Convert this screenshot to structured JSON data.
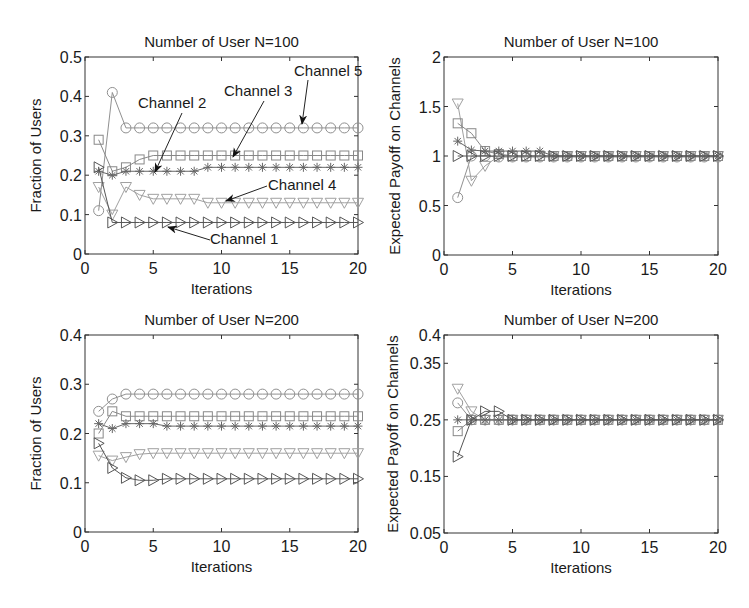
{
  "figure": {
    "background": "#ffffff",
    "axis_color": "#333333"
  },
  "series_styles": {
    "channel_1": {
      "marker": "triangle-right",
      "color": "#555555"
    },
    "channel_2": {
      "marker": "asterisk",
      "color": "#666666"
    },
    "channel_3": {
      "marker": "square",
      "color": "#888888"
    },
    "channel_4": {
      "marker": "triangle-down",
      "color": "#a0a0a0"
    },
    "channel_5": {
      "marker": "circle",
      "color": "#909090"
    }
  },
  "chart_data": [
    {
      "id": "top_left",
      "type": "line",
      "title": "Number of User N=100",
      "xlabel": "Iterations",
      "ylabel": "Fraction of Users",
      "xlim": [
        0,
        20
      ],
      "ylim": [
        0,
        0.5
      ],
      "xticks": [
        0,
        5,
        10,
        15,
        20
      ],
      "yticks": [
        0,
        0.1,
        0.2,
        0.3,
        0.4,
        0.5
      ],
      "ytick_labels": [
        "0",
        "0.1",
        "0.2",
        "0.3",
        "0.4",
        "0.5"
      ],
      "grid": false,
      "frame": {
        "x0": 85,
        "x1": 358,
        "y0": 57,
        "y1": 254
      },
      "x": [
        1,
        2,
        3,
        4,
        5,
        6,
        7,
        8,
        9,
        10,
        11,
        12,
        13,
        14,
        15,
        16,
        17,
        18,
        19,
        20
      ],
      "series": [
        {
          "name": "Channel 1",
          "style": "channel_1",
          "values": [
            0.22,
            0.08,
            0.08,
            0.08,
            0.08,
            0.08,
            0.08,
            0.08,
            0.08,
            0.08,
            0.08,
            0.08,
            0.08,
            0.08,
            0.08,
            0.08,
            0.08,
            0.08,
            0.08,
            0.08
          ]
        },
        {
          "name": "Channel 2",
          "style": "channel_2",
          "values": [
            0.21,
            0.2,
            0.21,
            0.21,
            0.21,
            0.21,
            0.21,
            0.21,
            0.22,
            0.22,
            0.22,
            0.22,
            0.22,
            0.22,
            0.22,
            0.22,
            0.22,
            0.22,
            0.22,
            0.22
          ]
        },
        {
          "name": "Channel 3",
          "style": "channel_3",
          "values": [
            0.29,
            0.21,
            0.22,
            0.24,
            0.25,
            0.25,
            0.25,
            0.25,
            0.25,
            0.25,
            0.25,
            0.25,
            0.25,
            0.25,
            0.25,
            0.25,
            0.25,
            0.25,
            0.25,
            0.25
          ]
        },
        {
          "name": "Channel 4",
          "style": "channel_4",
          "values": [
            0.17,
            0.1,
            0.17,
            0.15,
            0.14,
            0.14,
            0.14,
            0.14,
            0.13,
            0.13,
            0.13,
            0.13,
            0.13,
            0.13,
            0.13,
            0.13,
            0.13,
            0.13,
            0.13,
            0.13
          ]
        },
        {
          "name": "Channel 5",
          "style": "channel_5",
          "values": [
            0.11,
            0.41,
            0.32,
            0.32,
            0.32,
            0.32,
            0.32,
            0.32,
            0.32,
            0.32,
            0.32,
            0.32,
            0.32,
            0.32,
            0.32,
            0.32,
            0.32,
            0.32,
            0.32,
            0.32
          ]
        }
      ],
      "annotations": [
        {
          "text": "Channel 5",
          "text_x": 294,
          "text_y": 76,
          "arrow_from": [
            308,
            80
          ],
          "arrow_to": [
            302,
            124
          ]
        },
        {
          "text": "Channel 3",
          "text_x": 224,
          "text_y": 96,
          "arrow_from": [
            264,
            101
          ],
          "arrow_to": [
            233,
            157
          ]
        },
        {
          "text": "Channel 2",
          "text_x": 138,
          "text_y": 108,
          "arrow_from": [
            182,
            113
          ],
          "arrow_to": [
            155,
            172
          ]
        },
        {
          "text": "Channel 4",
          "text_x": 268,
          "text_y": 190,
          "arrow_from": [
            267,
            186
          ],
          "arrow_to": [
            226,
            201
          ]
        },
        {
          "text": "Channel 1",
          "text_x": 210,
          "text_y": 244,
          "arrow_from": [
            210,
            240
          ],
          "arrow_to": [
            168,
            227
          ]
        }
      ]
    },
    {
      "id": "top_right",
      "type": "line",
      "title": "Number of User N=100",
      "xlabel": "Iterations",
      "ylabel": "Expected Payoff on Channels",
      "xlim": [
        0,
        20
      ],
      "ylim": [
        0,
        2
      ],
      "xticks": [
        0,
        5,
        10,
        15,
        20
      ],
      "yticks": [
        0,
        0.5,
        1,
        1.5,
        2
      ],
      "ytick_labels": [
        "0",
        "0.5",
        "1",
        "1.5",
        "2"
      ],
      "grid": false,
      "frame": {
        "x0": 444,
        "x1": 718,
        "y0": 57,
        "y1": 255
      },
      "x": [
        1,
        2,
        3,
        4,
        5,
        6,
        7,
        8,
        9,
        10,
        11,
        12,
        13,
        14,
        15,
        16,
        17,
        18,
        19,
        20
      ],
      "series": [
        {
          "name": "Channel 1",
          "style": "channel_1",
          "values": [
            1.0,
            1.0,
            1.0,
            1.0,
            1.0,
            1.0,
            1.0,
            1.0,
            1.0,
            1.0,
            1.0,
            1.0,
            1.0,
            1.0,
            1.0,
            1.0,
            1.0,
            1.0,
            1.0,
            1.0
          ]
        },
        {
          "name": "Channel 2",
          "style": "channel_2",
          "values": [
            1.15,
            1.06,
            1.05,
            1.05,
            1.05,
            1.05,
            1.05,
            1.0,
            1.0,
            1.0,
            1.0,
            1.0,
            1.0,
            1.0,
            1.0,
            1.0,
            1.0,
            1.0,
            1.0,
            1.0
          ]
        },
        {
          "name": "Channel 3",
          "style": "channel_3",
          "values": [
            1.33,
            1.23,
            1.05,
            1.02,
            1.0,
            1.0,
            1.0,
            1.0,
            1.0,
            1.0,
            1.0,
            1.0,
            1.0,
            1.0,
            1.0,
            1.0,
            1.0,
            1.0,
            1.0,
            1.0
          ]
        },
        {
          "name": "Channel 4",
          "style": "channel_4",
          "values": [
            1.53,
            0.75,
            0.9,
            1.0,
            1.0,
            1.0,
            1.0,
            1.0,
            1.0,
            1.0,
            1.0,
            1.0,
            1.0,
            1.0,
            1.0,
            1.0,
            1.0,
            1.0,
            1.0,
            1.0
          ]
        },
        {
          "name": "Channel 5",
          "style": "channel_5",
          "values": [
            0.58,
            1.0,
            1.0,
            0.99,
            0.99,
            0.99,
            0.99,
            0.99,
            0.99,
            0.99,
            0.99,
            0.99,
            0.99,
            0.99,
            0.99,
            0.99,
            0.99,
            0.99,
            0.99,
            0.99
          ]
        }
      ],
      "annotations": []
    },
    {
      "id": "bottom_left",
      "type": "line",
      "title": "Number of User N=200",
      "xlabel": "Iterations",
      "ylabel": "Fraction of Users",
      "xlim": [
        0,
        20
      ],
      "ylim": [
        0,
        0.4
      ],
      "xticks": [
        0,
        5,
        10,
        15,
        20
      ],
      "yticks": [
        0,
        0.1,
        0.2,
        0.3,
        0.4
      ],
      "ytick_labels": [
        "0",
        "0.1",
        "0.2",
        "0.3",
        "0.4"
      ],
      "grid": false,
      "frame": {
        "x0": 85,
        "x1": 358,
        "y0": 335,
        "y1": 532
      },
      "x": [
        1,
        2,
        3,
        4,
        5,
        6,
        7,
        8,
        9,
        10,
        11,
        12,
        13,
        14,
        15,
        16,
        17,
        18,
        19,
        20
      ],
      "series": [
        {
          "name": "Channel 1",
          "style": "channel_1",
          "values": [
            0.18,
            0.13,
            0.11,
            0.105,
            0.105,
            0.108,
            0.108,
            0.108,
            0.108,
            0.108,
            0.108,
            0.108,
            0.108,
            0.108,
            0.108,
            0.108,
            0.108,
            0.108,
            0.108,
            0.108
          ]
        },
        {
          "name": "Channel 2",
          "style": "channel_2",
          "values": [
            0.22,
            0.21,
            0.22,
            0.22,
            0.22,
            0.215,
            0.215,
            0.215,
            0.215,
            0.215,
            0.215,
            0.215,
            0.215,
            0.215,
            0.215,
            0.215,
            0.215,
            0.215,
            0.215,
            0.215
          ]
        },
        {
          "name": "Channel 3",
          "style": "channel_3",
          "values": [
            0.2,
            0.245,
            0.235,
            0.235,
            0.235,
            0.235,
            0.235,
            0.235,
            0.235,
            0.235,
            0.235,
            0.235,
            0.235,
            0.235,
            0.235,
            0.235,
            0.235,
            0.235,
            0.235,
            0.235
          ]
        },
        {
          "name": "Channel 4",
          "style": "channel_4",
          "values": [
            0.155,
            0.145,
            0.152,
            0.158,
            0.16,
            0.16,
            0.16,
            0.16,
            0.16,
            0.16,
            0.16,
            0.16,
            0.16,
            0.16,
            0.16,
            0.16,
            0.16,
            0.16,
            0.16,
            0.16
          ]
        },
        {
          "name": "Channel 5",
          "style": "channel_5",
          "values": [
            0.245,
            0.27,
            0.28,
            0.28,
            0.28,
            0.28,
            0.28,
            0.28,
            0.28,
            0.28,
            0.28,
            0.28,
            0.28,
            0.28,
            0.28,
            0.28,
            0.28,
            0.28,
            0.28,
            0.28
          ]
        }
      ],
      "annotations": []
    },
    {
      "id": "bottom_right",
      "type": "line",
      "title": "Number of User N=200",
      "xlabel": "Iterations",
      "ylabel": "Expected Payoff on Channels",
      "xlim": [
        0,
        20
      ],
      "ylim": [
        0.05,
        0.4
      ],
      "xticks": [
        0,
        5,
        10,
        15,
        20
      ],
      "yticks": [
        0.05,
        0.15,
        0.25,
        0.35,
        0.4
      ],
      "ytick_labels": [
        "0.05",
        "0.15",
        "0.25",
        "0.35",
        "0.4"
      ],
      "grid": false,
      "frame": {
        "x0": 444,
        "x1": 718,
        "y0": 335,
        "y1": 533
      },
      "x": [
        1,
        2,
        3,
        4,
        5,
        6,
        7,
        8,
        9,
        10,
        11,
        12,
        13,
        14,
        15,
        16,
        17,
        18,
        19,
        20
      ],
      "series": [
        {
          "name": "Channel 1",
          "style": "channel_1",
          "values": [
            0.185,
            0.25,
            0.265,
            0.265,
            0.25,
            0.25,
            0.25,
            0.25,
            0.25,
            0.25,
            0.25,
            0.25,
            0.25,
            0.25,
            0.25,
            0.25,
            0.25,
            0.25,
            0.25,
            0.25
          ]
        },
        {
          "name": "Channel 2",
          "style": "channel_2",
          "values": [
            0.25,
            0.25,
            0.25,
            0.25,
            0.25,
            0.25,
            0.25,
            0.25,
            0.25,
            0.25,
            0.25,
            0.25,
            0.25,
            0.25,
            0.25,
            0.25,
            0.25,
            0.25,
            0.25,
            0.25
          ]
        },
        {
          "name": "Channel 3",
          "style": "channel_3",
          "values": [
            0.23,
            0.25,
            0.25,
            0.25,
            0.25,
            0.25,
            0.25,
            0.25,
            0.25,
            0.25,
            0.25,
            0.25,
            0.25,
            0.25,
            0.25,
            0.25,
            0.25,
            0.25,
            0.25,
            0.25
          ]
        },
        {
          "name": "Channel 4",
          "style": "channel_4",
          "values": [
            0.305,
            0.265,
            0.25,
            0.25,
            0.25,
            0.25,
            0.25,
            0.25,
            0.25,
            0.25,
            0.25,
            0.25,
            0.25,
            0.25,
            0.25,
            0.25,
            0.25,
            0.25,
            0.25,
            0.25
          ]
        },
        {
          "name": "Channel 5",
          "style": "channel_5",
          "values": [
            0.28,
            0.25,
            0.25,
            0.25,
            0.25,
            0.25,
            0.25,
            0.25,
            0.25,
            0.25,
            0.25,
            0.25,
            0.25,
            0.25,
            0.25,
            0.25,
            0.25,
            0.25,
            0.25,
            0.25
          ]
        }
      ],
      "annotations": []
    }
  ]
}
